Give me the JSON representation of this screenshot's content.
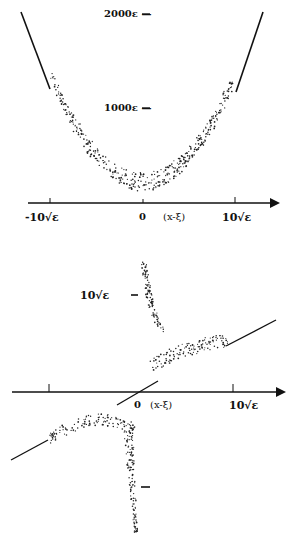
{
  "chart_data": [
    {
      "type": "scatter",
      "title": "",
      "xlabel": "(x-ξ)",
      "ylabel": "",
      "x_ticks": [
        "-10√ε",
        "0",
        "10√ε"
      ],
      "y_ticks": [
        "1000ε",
        "2000ε"
      ],
      "description": "Parabolic band of scattered points centered at 0 with straight-line asymptotes at both ends",
      "curve": "y ∝ (x-ξ)^2",
      "x_range": [
        -10,
        10
      ],
      "y_range": [
        0,
        2000
      ]
    },
    {
      "type": "scatter",
      "title": "",
      "xlabel": "(x-ξ)",
      "ylabel": "",
      "x_ticks": [
        "0",
        "10√ε"
      ],
      "y_ticks": [
        "10√ε"
      ],
      "description": "Upper branch: steep descent near x≈0.6 flattening to a linear asymptote; lower branch mirrored below the axis with linear asymptote on the left"
    }
  ],
  "labels": {
    "top_y_2000": "2000ε —",
    "top_y_1000": "1000ε —",
    "top_x_neg": "-10√ε",
    "top_x_zero": "0",
    "top_x_var": "(x-ξ)",
    "top_x_pos": "10√ε",
    "bot_y_upper": "10√ε",
    "bot_x_zero": "0",
    "bot_x_var": "(x-ξ)",
    "bot_x_pos": "10√ε"
  }
}
